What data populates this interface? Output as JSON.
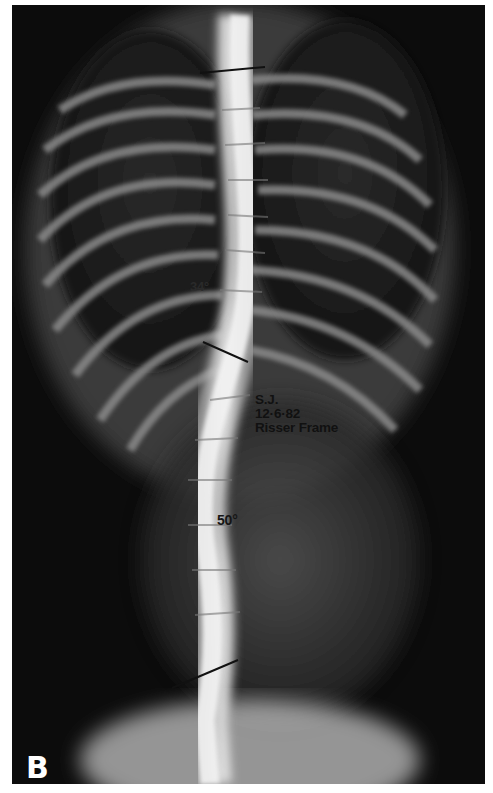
{
  "image": {
    "description": "Frontal spine radiograph showing scoliosis with Cobb angle measurement lines",
    "panel_label": "B"
  },
  "annotations": {
    "upper_angle": "34°",
    "lower_angle": "50°",
    "patient": {
      "initials": "S.J.",
      "date": "12·6·82",
      "note": "Risser Frame"
    }
  },
  "measurement_lines": [
    {
      "name": "upper-endplate-line",
      "x1": 200,
      "y1": 73,
      "x2": 265,
      "y2": 67
    },
    {
      "name": "apical-endplate-line",
      "x1": 203,
      "y1": 342,
      "x2": 248,
      "y2": 362
    },
    {
      "name": "lower-endplate-line",
      "x1": 172,
      "y1": 688,
      "x2": 238,
      "y2": 660
    }
  ],
  "colors": {
    "background": "#0a0a0a",
    "bone": "#e8e8e8",
    "text": "#111111",
    "panel_letter": "#ffffff"
  }
}
